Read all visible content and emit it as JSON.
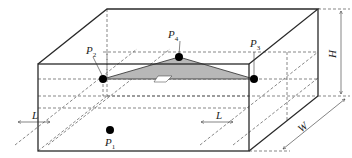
{
  "diagram": {
    "type": "3d-box-sensor-layout",
    "points": [
      {
        "id": "P1",
        "label": "P",
        "sub": "1"
      },
      {
        "id": "P2",
        "label": "P",
        "sub": "2"
      },
      {
        "id": "P3",
        "label": "P",
        "sub": "3"
      },
      {
        "id": "P4",
        "label": "P",
        "sub": "4"
      }
    ],
    "dimensions": {
      "height": "H",
      "width": "W",
      "offset_left": "L",
      "offset_right": "L"
    },
    "colors": {
      "line": "#2a2a2a",
      "triangle_fill": "#b8b8b8",
      "point": "#000000"
    }
  }
}
